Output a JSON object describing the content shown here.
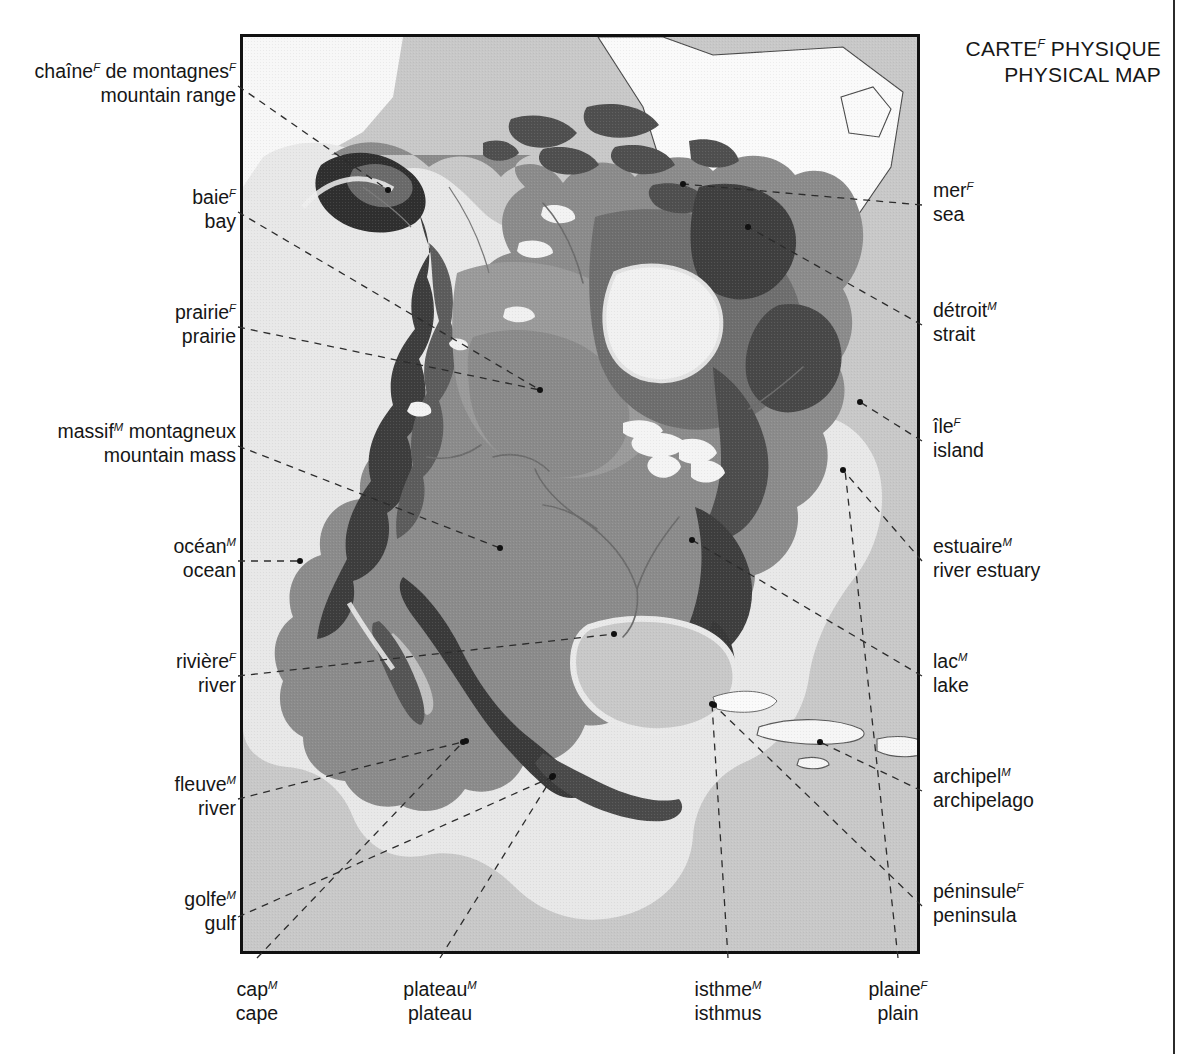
{
  "title": {
    "line_fr": "CARTE",
    "line_fr_gender": "F",
    "line_fr_rest": " PHYSIQUE",
    "line_en": "PHYSICAL MAP"
  },
  "map": {
    "name": "north-america-physical-relief",
    "ocean_color": "#c8c8c8",
    "shelf_color": "#e9e9e9",
    "land_low_color": "#8f8f8f",
    "land_mid_color": "#6f6f6f",
    "land_high_color": "#4a4a4a",
    "land_peak_color": "#2e2e2e",
    "lake_color": "#f4f4f4",
    "frame_color": "#111111"
  },
  "labels_left": [
    {
      "id": "mountain-range",
      "fr": "chaîne",
      "fr_gender": "F",
      "fr_rest": " de montagnes",
      "fr_rest_gender": "F",
      "en": "mountain range"
    },
    {
      "id": "bay",
      "fr": "baie",
      "fr_gender": "F",
      "fr_rest": "",
      "en": "bay"
    },
    {
      "id": "prairie",
      "fr": "prairie",
      "fr_gender": "F",
      "fr_rest": "",
      "en": "prairie"
    },
    {
      "id": "mountain-mass",
      "fr": "massif",
      "fr_gender": "M",
      "fr_rest": " montagneux",
      "en": "mountain mass"
    },
    {
      "id": "ocean",
      "fr": "océan",
      "fr_gender": "M",
      "fr_rest": "",
      "en": "ocean"
    },
    {
      "id": "river-riviere",
      "fr": "rivière",
      "fr_gender": "F",
      "fr_rest": "",
      "en": "river"
    },
    {
      "id": "river-fleuve",
      "fr": "fleuve",
      "fr_gender": "M",
      "fr_rest": "",
      "en": "river"
    },
    {
      "id": "gulf",
      "fr": "golfe",
      "fr_gender": "M",
      "fr_rest": "",
      "en": "gulf"
    }
  ],
  "labels_right": [
    {
      "id": "sea",
      "fr": "mer",
      "fr_gender": "F",
      "fr_rest": "",
      "en": "sea"
    },
    {
      "id": "strait",
      "fr": "détroit",
      "fr_gender": "M",
      "fr_rest": "",
      "en": "strait"
    },
    {
      "id": "island",
      "fr": "île",
      "fr_gender": "F",
      "fr_rest": "",
      "en": "island"
    },
    {
      "id": "river-estuary",
      "fr": "estuaire",
      "fr_gender": "M",
      "fr_rest": "",
      "en": "river estuary"
    },
    {
      "id": "lake",
      "fr": "lac",
      "fr_gender": "M",
      "fr_rest": "",
      "en": "lake"
    },
    {
      "id": "archipelago",
      "fr": "archipel",
      "fr_gender": "M",
      "fr_rest": "",
      "en": "archipelago"
    },
    {
      "id": "peninsula",
      "fr": "péninsule",
      "fr_gender": "F",
      "fr_rest": "",
      "en": "peninsula"
    }
  ],
  "labels_bottom": [
    {
      "id": "cape",
      "fr": "cap",
      "fr_gender": "M",
      "fr_rest": "",
      "en": "cape"
    },
    {
      "id": "plateau",
      "fr": "plateau",
      "fr_gender": "M",
      "fr_rest": "",
      "en": "plateau"
    },
    {
      "id": "isthmus",
      "fr": "isthme",
      "fr_gender": "M",
      "fr_rest": "",
      "en": "isthmus"
    },
    {
      "id": "plain",
      "fr": "plaine",
      "fr_gender": "F",
      "fr_rest": "",
      "en": "plain"
    }
  ]
}
